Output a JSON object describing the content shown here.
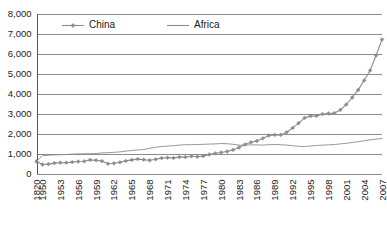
{
  "chart_data": {
    "type": "line",
    "title": "",
    "subtitle": "",
    "xlabel": "",
    "ylabel": "",
    "ylim": [
      0,
      8000
    ],
    "grid": true,
    "legend_position": "top-left-inside",
    "y_ticks": [
      "0",
      "1,000",
      "2,000",
      "3,000",
      "4,000",
      "5,000",
      "6,000",
      "7,000",
      "8,000"
    ],
    "y_tick_values": [
      0,
      1000,
      2000,
      3000,
      4000,
      5000,
      6000,
      7000,
      8000
    ],
    "x_tick_labels": [
      "1820",
      "1950",
      "1953",
      "1956",
      "1959",
      "1962",
      "1965",
      "1968",
      "1971",
      "1974",
      "1977",
      "1980",
      "1983",
      "1986",
      "1989",
      "1992",
      "1995",
      "1998",
      "2001",
      "2004",
      "2007"
    ],
    "x": [
      "1820",
      "1950",
      "1951",
      "1952",
      "1953",
      "1954",
      "1955",
      "1956",
      "1957",
      "1958",
      "1959",
      "1960",
      "1961",
      "1962",
      "1963",
      "1964",
      "1965",
      "1966",
      "1967",
      "1968",
      "1969",
      "1970",
      "1971",
      "1972",
      "1973",
      "1974",
      "1975",
      "1976",
      "1977",
      "1978",
      "1979",
      "1980",
      "1981",
      "1982",
      "1983",
      "1984",
      "1985",
      "1986",
      "1987",
      "1988",
      "1989",
      "1990",
      "1991",
      "1992",
      "1993",
      "1994",
      "1995",
      "1996",
      "1997",
      "1998",
      "1999",
      "2000",
      "2001",
      "2002",
      "2003",
      "2004",
      "2005",
      "2006",
      "2007"
    ],
    "series": [
      {
        "name": "China",
        "color": "#8c8c8c",
        "marker": "diamond",
        "values": [
          600,
          450,
          470,
          520,
          540,
          540,
          570,
          600,
          610,
          680,
          660,
          620,
          490,
          510,
          560,
          630,
          680,
          720,
          690,
          660,
          710,
          770,
          790,
          780,
          820,
          820,
          860,
          840,
          870,
          950,
          1010,
          1050,
          1100,
          1180,
          1300,
          1450,
          1560,
          1630,
          1760,
          1900,
          1930,
          1930,
          2060,
          2280,
          2520,
          2780,
          2870,
          2880,
          2970,
          3000,
          3020,
          3180,
          3450,
          3800,
          4180,
          4650,
          5150,
          5900,
          6700
        ]
      },
      {
        "name": "Africa",
        "color": "#8c8c8c",
        "marker": "none",
        "values": [
          600,
          890,
          910,
          930,
          940,
          950,
          970,
          980,
          985,
          990,
          1000,
          1030,
          1040,
          1060,
          1080,
          1120,
          1150,
          1180,
          1200,
          1260,
          1310,
          1350,
          1370,
          1390,
          1420,
          1440,
          1440,
          1450,
          1460,
          1470,
          1480,
          1500,
          1490,
          1460,
          1420,
          1420,
          1430,
          1430,
          1420,
          1440,
          1450,
          1440,
          1420,
          1390,
          1360,
          1350,
          1370,
          1400,
          1420,
          1430,
          1450,
          1480,
          1510,
          1550,
          1590,
          1640,
          1680,
          1720,
          1750
        ]
      }
    ]
  },
  "legend": {
    "items": [
      {
        "label": "China"
      },
      {
        "label": "Africa"
      }
    ]
  }
}
